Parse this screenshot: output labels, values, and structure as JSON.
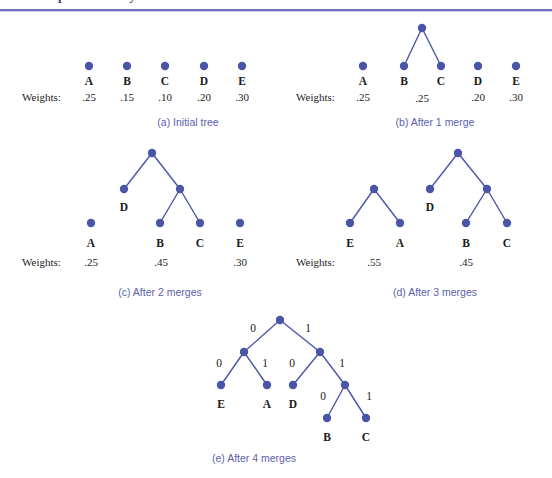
{
  "header": {
    "clipped_title": "Chapter 5  Binary Trees",
    "rule_color": "#6b72b8"
  },
  "figure": {
    "node_color": "#4a55a8",
    "edge_color": "#4a55a8",
    "caption_color": "#5a61ab",
    "weights_label": "Weights:",
    "panels": [
      {
        "id": "a",
        "caption": "(a)  Initial tree",
        "caption_x": 188,
        "caption_y": 117,
        "weights_label_x": 22,
        "weights_label_y": 92,
        "nodes": [
          {
            "name": "leaf-a",
            "x": 89,
            "y": 66,
            "label": "A",
            "label_x": 89,
            "label_y": 76,
            "weight": ".25",
            "weight_x": 89,
            "weight_y": 92
          },
          {
            "name": "leaf-b",
            "x": 127,
            "y": 66,
            "label": "B",
            "label_x": 127,
            "label_y": 76,
            "weight": ".15",
            "weight_x": 127,
            "weight_y": 92
          },
          {
            "name": "leaf-c",
            "x": 165,
            "y": 66,
            "label": "C",
            "label_x": 165,
            "label_y": 76,
            "weight": ".10",
            "weight_x": 165,
            "weight_y": 92
          },
          {
            "name": "leaf-d",
            "x": 204,
            "y": 66,
            "label": "D",
            "label_x": 204,
            "label_y": 76,
            "weight": ".20",
            "weight_x": 204,
            "weight_y": 92
          },
          {
            "name": "leaf-e",
            "x": 242,
            "y": 66,
            "label": "E",
            "label_x": 242,
            "label_y": 76,
            "weight": ".30",
            "weight_x": 242,
            "weight_y": 92
          }
        ],
        "edges": [],
        "edge_labels": []
      },
      {
        "id": "b",
        "caption": "(b)  After 1 merge",
        "caption_x": 435,
        "caption_y": 117,
        "weights_label_x": 296,
        "weights_label_y": 92,
        "nodes": [
          {
            "name": "leaf-a",
            "x": 363,
            "y": 66,
            "label": "A",
            "label_x": 363,
            "label_y": 76,
            "weight": ".25",
            "weight_x": 363,
            "weight_y": 92
          },
          {
            "name": "leaf-b",
            "x": 404,
            "y": 66,
            "label": "B",
            "label_x": 404,
            "label_y": 76,
            "weight": null,
            "weight_x": null,
            "weight_y": null
          },
          {
            "name": "leaf-c",
            "x": 441,
            "y": 66,
            "label": "C",
            "label_x": 441,
            "label_y": 76,
            "weight": null,
            "weight_x": null,
            "weight_y": null
          },
          {
            "name": "internal-bc",
            "x": 422,
            "y": 28,
            "label": null,
            "label_x": null,
            "label_y": null,
            "weight": ".25",
            "weight_x": 422,
            "weight_y": 93
          },
          {
            "name": "leaf-d",
            "x": 478,
            "y": 66,
            "label": "D",
            "label_x": 478,
            "label_y": 76,
            "weight": ".20",
            "weight_x": 478,
            "weight_y": 92
          },
          {
            "name": "leaf-e",
            "x": 516,
            "y": 66,
            "label": "E",
            "label_x": 516,
            "label_y": 76,
            "weight": ".30",
            "weight_x": 516,
            "weight_y": 92
          }
        ],
        "edges": [
          {
            "x1": 422,
            "y1": 28,
            "x2": 404,
            "y2": 66
          },
          {
            "x1": 422,
            "y1": 28,
            "x2": 441,
            "y2": 66
          }
        ],
        "edge_labels": []
      },
      {
        "id": "c",
        "caption": "(c)  After 2 merges",
        "caption_x": 160,
        "caption_y": 287,
        "weights_label_x": 22,
        "weights_label_y": 257,
        "nodes": [
          {
            "name": "root",
            "x": 152,
            "y": 153,
            "label": null,
            "label_x": null,
            "label_y": null,
            "weight": null,
            "weight_x": null,
            "weight_y": null
          },
          {
            "name": "leaf-d",
            "x": 124,
            "y": 189,
            "label": "D",
            "label_x": 124,
            "label_y": 202,
            "weight": null,
            "weight_x": null,
            "weight_y": null
          },
          {
            "name": "internal-bc",
            "x": 180,
            "y": 189,
            "label": null,
            "label_x": null,
            "label_y": null,
            "weight": null,
            "weight_x": null,
            "weight_y": null
          },
          {
            "name": "leaf-b",
            "x": 160,
            "y": 223,
            "label": "B",
            "label_x": 160,
            "label_y": 238,
            "weight": null,
            "weight_x": null,
            "weight_y": null
          },
          {
            "name": "leaf-c",
            "x": 200,
            "y": 223,
            "label": "C",
            "label_x": 200,
            "label_y": 238,
            "weight": null,
            "weight_x": null,
            "weight_y": null
          },
          {
            "name": "leaf-a",
            "x": 91,
            "y": 223,
            "label": "A",
            "label_x": 91,
            "label_y": 238,
            "weight": ".25",
            "weight_x": 91,
            "weight_y": 257
          },
          {
            "name": "leaf-e",
            "x": 240,
            "y": 223,
            "label": "E",
            "label_x": 240,
            "label_y": 238,
            "weight": ".30",
            "weight_x": 240,
            "weight_y": 257
          }
        ],
        "edges": [
          {
            "x1": 152,
            "y1": 153,
            "x2": 124,
            "y2": 189
          },
          {
            "x1": 152,
            "y1": 153,
            "x2": 180,
            "y2": 189
          },
          {
            "x1": 180,
            "y1": 189,
            "x2": 160,
            "y2": 223
          },
          {
            "x1": 180,
            "y1": 189,
            "x2": 200,
            "y2": 223
          }
        ],
        "subtree_weights": [
          {
            "value": ".45",
            "x": 161,
            "y": 257
          }
        ],
        "edge_labels": []
      },
      {
        "id": "d",
        "caption": "(d)  After 3 merges",
        "caption_x": 435,
        "caption_y": 287,
        "weights_label_x": 296,
        "weights_label_y": 257,
        "nodes": [
          {
            "name": "root-ea",
            "x": 374,
            "y": 189,
            "label": null,
            "label_x": null,
            "label_y": null,
            "weight": null,
            "weight_x": null,
            "weight_y": null
          },
          {
            "name": "leaf-e",
            "x": 350,
            "y": 223,
            "label": "E",
            "label_x": 350,
            "label_y": 238,
            "weight": null,
            "weight_x": null,
            "weight_y": null
          },
          {
            "name": "leaf-a",
            "x": 400,
            "y": 223,
            "label": "A",
            "label_x": 400,
            "label_y": 238,
            "weight": null,
            "weight_x": null,
            "weight_y": null
          },
          {
            "name": "root-dbc",
            "x": 458,
            "y": 153,
            "label": null,
            "label_x": null,
            "label_y": null,
            "weight": null,
            "weight_x": null,
            "weight_y": null
          },
          {
            "name": "leaf-d",
            "x": 430,
            "y": 189,
            "label": "D",
            "label_x": 430,
            "label_y": 202,
            "weight": null,
            "weight_x": null,
            "weight_y": null
          },
          {
            "name": "internal-bc",
            "x": 487,
            "y": 189,
            "label": null,
            "label_x": null,
            "label_y": null,
            "weight": null,
            "weight_x": null,
            "weight_y": null
          },
          {
            "name": "leaf-b",
            "x": 466,
            "y": 223,
            "label": "B",
            "label_x": 466,
            "label_y": 238,
            "weight": null,
            "weight_x": null,
            "weight_y": null
          },
          {
            "name": "leaf-c",
            "x": 507,
            "y": 223,
            "label": "C",
            "label_x": 507,
            "label_y": 238,
            "weight": null,
            "weight_x": null,
            "weight_y": null
          }
        ],
        "edges": [
          {
            "x1": 374,
            "y1": 189,
            "x2": 350,
            "y2": 223
          },
          {
            "x1": 374,
            "y1": 189,
            "x2": 400,
            "y2": 223
          },
          {
            "x1": 458,
            "y1": 153,
            "x2": 430,
            "y2": 189
          },
          {
            "x1": 458,
            "y1": 153,
            "x2": 487,
            "y2": 189
          },
          {
            "x1": 487,
            "y1": 189,
            "x2": 466,
            "y2": 223
          },
          {
            "x1": 487,
            "y1": 189,
            "x2": 507,
            "y2": 223
          }
        ],
        "subtree_weights": [
          {
            "value": ".55",
            "x": 374,
            "y": 257
          },
          {
            "value": ".45",
            "x": 466,
            "y": 257
          }
        ],
        "edge_labels": []
      },
      {
        "id": "e",
        "caption": "(e)  After 4 merges",
        "caption_x": 254,
        "caption_y": 453,
        "weights_label_x": null,
        "weights_label_y": null,
        "nodes": [
          {
            "name": "root",
            "x": 280,
            "y": 320,
            "label": null,
            "label_x": null,
            "label_y": null,
            "weight": null,
            "weight_x": null,
            "weight_y": null
          },
          {
            "name": "internal-ea",
            "x": 244,
            "y": 352,
            "label": null,
            "label_x": null,
            "label_y": null,
            "weight": null,
            "weight_x": null,
            "weight_y": null
          },
          {
            "name": "internal-dbc",
            "x": 320,
            "y": 352,
            "label": null,
            "label_x": null,
            "label_y": null,
            "weight": null,
            "weight_x": null,
            "weight_y": null
          },
          {
            "name": "leaf-e",
            "x": 221,
            "y": 385,
            "label": "E",
            "label_x": 221,
            "label_y": 399,
            "weight": null,
            "weight_x": null,
            "weight_y": null
          },
          {
            "name": "leaf-a",
            "x": 267,
            "y": 385,
            "label": "A",
            "label_x": 267,
            "label_y": 399,
            "weight": null,
            "weight_x": null,
            "weight_y": null
          },
          {
            "name": "leaf-d",
            "x": 293,
            "y": 385,
            "label": "D",
            "label_x": 293,
            "label_y": 399,
            "weight": null,
            "weight_x": null,
            "weight_y": null
          },
          {
            "name": "internal-bc",
            "x": 345,
            "y": 385,
            "label": null,
            "label_x": null,
            "label_y": null,
            "weight": null,
            "weight_x": null,
            "weight_y": null
          },
          {
            "name": "leaf-b",
            "x": 327,
            "y": 418,
            "label": "B",
            "label_x": 327,
            "label_y": 432,
            "weight": null,
            "weight_x": null,
            "weight_y": null
          },
          {
            "name": "leaf-c",
            "x": 366,
            "y": 418,
            "label": "C",
            "label_x": 366,
            "label_y": 432,
            "weight": null,
            "weight_x": null,
            "weight_y": null
          }
        ],
        "edges": [
          {
            "x1": 280,
            "y1": 320,
            "x2": 244,
            "y2": 352
          },
          {
            "x1": 280,
            "y1": 320,
            "x2": 320,
            "y2": 352
          },
          {
            "x1": 244,
            "y1": 352,
            "x2": 221,
            "y2": 385
          },
          {
            "x1": 244,
            "y1": 352,
            "x2": 267,
            "y2": 385
          },
          {
            "x1": 320,
            "y1": 352,
            "x2": 293,
            "y2": 385
          },
          {
            "x1": 320,
            "y1": 352,
            "x2": 345,
            "y2": 385
          },
          {
            "x1": 345,
            "y1": 385,
            "x2": 327,
            "y2": 418
          },
          {
            "x1": 345,
            "y1": 385,
            "x2": 366,
            "y2": 418
          }
        ],
        "edge_labels": [
          {
            "text": "0",
            "x": 253,
            "y": 329
          },
          {
            "text": "1",
            "x": 308,
            "y": 329
          },
          {
            "text": "0",
            "x": 219,
            "y": 364
          },
          {
            "text": "1",
            "x": 265,
            "y": 364
          },
          {
            "text": "0",
            "x": 292,
            "y": 364
          },
          {
            "text": "1",
            "x": 342,
            "y": 364
          },
          {
            "text": "0",
            "x": 323,
            "y": 397
          },
          {
            "text": "1",
            "x": 369,
            "y": 397
          }
        ]
      }
    ]
  }
}
